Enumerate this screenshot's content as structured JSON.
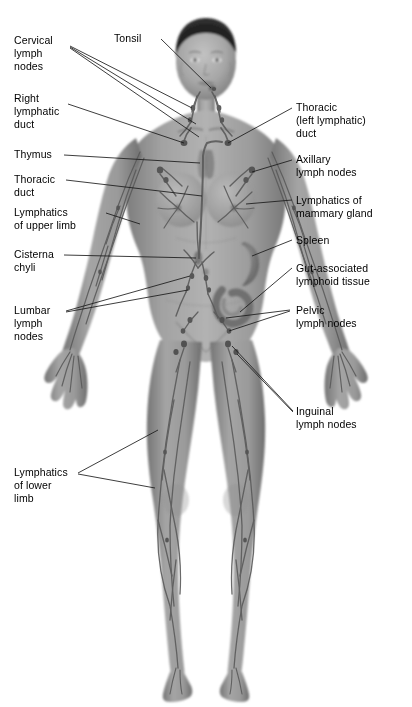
{
  "figure": {
    "background_color": "#ffffff",
    "text_color": "#000000",
    "leader_line_color": "#1a1a1a",
    "width": 412,
    "height": 707
  },
  "labels": {
    "tonsil": "Tonsil",
    "cervical_lymph_nodes": "Cervical\nlymph\nnodes",
    "right_lymphatic_duct": "Right\nlymphatic\nduct",
    "thymus": "Thymus",
    "thoracic_duct": "Thoracic\nduct",
    "lymphatics_upper_limb": "Lymphatics\nof upper limb",
    "cisterna_chyli": "Cisterna\nchyli",
    "lumbar_lymph_nodes": "Lumbar\nlymph\nnodes",
    "lymphatics_lower_limb": "Lymphatics\nof lower\nlimb",
    "thoracic_left_lymphatic_duct": "Thoracic\n(left lymphatic)\nduct",
    "axillary_lymph_nodes": "Axillary\nlymph nodes",
    "lymphatics_mammary_gland": "Lymphatics of\nmammary gland",
    "spleen": "Spleen",
    "gut_associated_lymphoid_tissue": "Gut-associated\nlymphoid tissue",
    "pelvic_lymph_nodes": "Pelvic\nlymph nodes",
    "inguinal_lymph_nodes": "Inguinal\nlymph nodes"
  },
  "anatomy": {
    "figure_description": "Anterior view of a female human body, grayscale airbrush illustration, showing the lymphatic vessel network and lymphoid organs",
    "skin_tone": "#9a9a9a",
    "hair_color": "#2e2e2e",
    "vessel_color": "#5c5c5c",
    "organs": [
      "tonsil",
      "thymus",
      "spleen",
      "gut-associated lymphoid tissue",
      "cisterna chyli"
    ]
  }
}
